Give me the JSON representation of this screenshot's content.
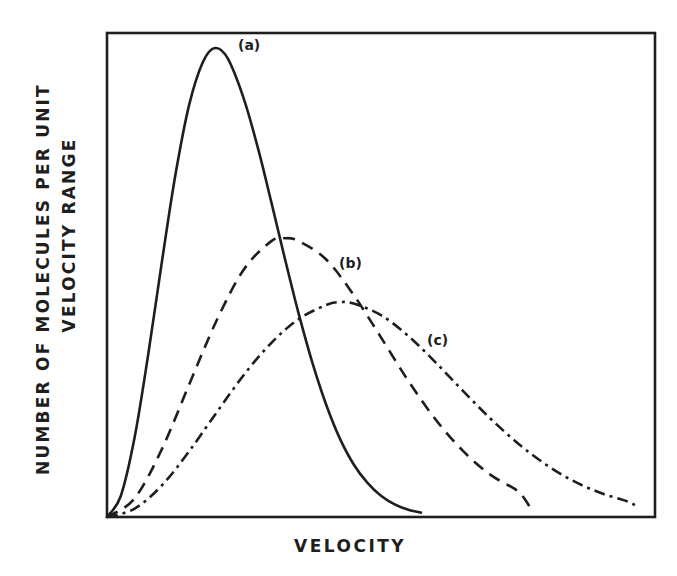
{
  "chart_data": {
    "type": "line",
    "title": "",
    "xlabel": "VELOCITY",
    "ylabel": [
      "NUMBER OF MOLECULES PER UNIT",
      "VELOCITY RANGE"
    ],
    "xlim": [
      0,
      10
    ],
    "ylim": [
      0,
      100
    ],
    "grid": false,
    "legend": "inline labels",
    "x_ticks": [],
    "y_ticks": [],
    "series": [
      {
        "name": "(a)",
        "style": "solid",
        "color": "#1e1e1e",
        "peak": {
          "x": 1.97,
          "y": 96.9
        },
        "x": [
          0,
          0.25,
          0.5,
          0.75,
          1.0,
          1.25,
          1.5,
          1.75,
          1.97,
          2.2,
          2.5,
          2.75,
          3.0,
          3.25,
          3.5,
          3.75,
          4.0,
          4.25,
          4.5,
          4.75,
          5.0,
          5.25,
          5.5,
          5.73
        ],
        "y": [
          0,
          4.3,
          16.2,
          33.4,
          52.6,
          70.8,
          85.2,
          94.0,
          96.9,
          94.8,
          86.3,
          76.4,
          65.0,
          53.2,
          41.9,
          31.8,
          23.2,
          16.2,
          10.9,
          7.1,
          4.4,
          2.6,
          1.5,
          0.9
        ]
      },
      {
        "name": "(b)",
        "style": "dashed",
        "color": "#1e1e1e",
        "peak": {
          "x": 3.25,
          "y": 57.6
        },
        "x": [
          0,
          0.5,
          1.0,
          1.5,
          2.0,
          2.5,
          3.0,
          3.25,
          3.5,
          4.0,
          4.5,
          5.0,
          5.5,
          6.0,
          6.5,
          7.0,
          7.5,
          7.72
        ],
        "y": [
          0,
          3.8,
          14.0,
          27.4,
          40.6,
          51.2,
          57.0,
          57.6,
          57.0,
          53.2,
          45.9,
          37.1,
          28.1,
          20.1,
          13.6,
          8.7,
          5.3,
          2.0
        ]
      },
      {
        "name": "(c)",
        "style": "dash-dot",
        "color": "#1e1e1e",
        "peak": {
          "x": 4.25,
          "y": 44.4
        },
        "x": [
          0,
          0.5,
          1.0,
          1.5,
          2.0,
          2.5,
          3.0,
          3.5,
          4.0,
          4.25,
          4.5,
          5.0,
          5.5,
          6.0,
          6.5,
          7.0,
          7.5,
          8.0,
          8.5,
          9.0,
          9.5,
          9.71
        ],
        "y": [
          0,
          1.7,
          6.5,
          13.6,
          21.6,
          29.4,
          36.0,
          40.9,
          43.8,
          44.4,
          44.1,
          41.7,
          37.4,
          31.9,
          26.0,
          20.3,
          15.2,
          10.9,
          7.5,
          5.0,
          3.2,
          1.9
        ]
      }
    ],
    "annotations": [
      {
        "text": "(a)",
        "x": 2.58,
        "y": 97.5
      },
      {
        "text": "(b)",
        "x": 4.5,
        "y": 52.0
      },
      {
        "text": "(c)",
        "x": 6.08,
        "y": 36.0
      }
    ]
  },
  "labels": {
    "ylabel_line1": "NUMBER OF MOLECULES PER UNIT",
    "ylabel_line2": "VELOCITY RANGE",
    "xlabel": "VELOCITY",
    "curve_a": "(a)",
    "curve_b": "(b)",
    "curve_c": "(c)"
  }
}
